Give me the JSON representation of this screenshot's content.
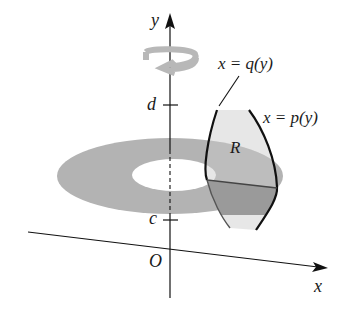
{
  "figure": {
    "axes": {
      "x_label": "x",
      "y_label": "y",
      "origin_label": "O"
    },
    "ticks": {
      "upper": "d",
      "lower": "c"
    },
    "curves": {
      "inner": "x = q(y)",
      "outer": "x = p(y)"
    },
    "region_label": "R",
    "colors": {
      "washer": "#b3b3b3",
      "region": "#e3e3e3",
      "overlap": "#9a9a9a",
      "swirl": "#b8b8b8",
      "ink": "#111111",
      "background": "#ffffff"
    }
  }
}
